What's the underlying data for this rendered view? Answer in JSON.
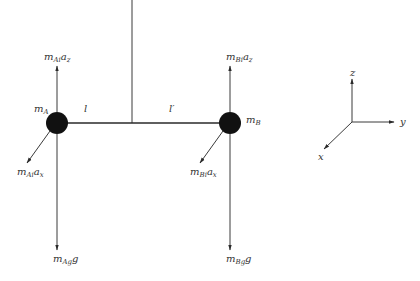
{
  "diagram": {
    "colors": {
      "ink": "#333333",
      "mass": "#111111",
      "background": "#ffffff"
    },
    "masses": [
      {
        "id": "A",
        "label_main": "m",
        "label_sub": "A",
        "up_force": {
          "main": "m",
          "sub": "Ai",
          "tail": "a",
          "tail_sub": "z"
        },
        "diag_force": {
          "main": "m",
          "sub": "Ai",
          "tail": "a",
          "tail_sub": "x"
        },
        "down_force": {
          "main": "m",
          "sub": "Ag",
          "tail": "g"
        }
      },
      {
        "id": "B",
        "label_main": "m",
        "label_sub": "B",
        "up_force": {
          "main": "m",
          "sub": "Bi",
          "tail": "a",
          "tail_sub": "z"
        },
        "diag_force": {
          "main": "m",
          "sub": "Bi",
          "tail": "a",
          "tail_sub": "x"
        },
        "down_force": {
          "main": "m",
          "sub": "Bg",
          "tail": "g"
        }
      }
    ],
    "lengths": {
      "left": "l",
      "right": "l′"
    },
    "axes": {
      "z": "z",
      "y": "y",
      "x": "x"
    }
  }
}
